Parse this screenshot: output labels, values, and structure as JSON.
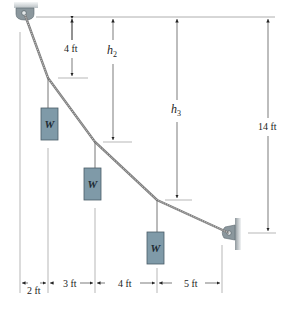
{
  "figure": {
    "type": "cable with three suspended weights",
    "weights": [
      {
        "label": "W"
      },
      {
        "label": "W"
      },
      {
        "label": "W"
      }
    ],
    "vertical_dimensions": [
      {
        "label": "4 ft"
      },
      {
        "label": "h",
        "sub": "2"
      },
      {
        "label": "h",
        "sub": "3"
      },
      {
        "label": "14 ft"
      }
    ],
    "horizontal_dimensions": [
      {
        "label": "2 ft"
      },
      {
        "label": "3 ft"
      },
      {
        "label": "4 ft"
      },
      {
        "label": "5 ft"
      }
    ],
    "colors": {
      "weight_fill": "#7f9aa8",
      "weight_stroke": "#4a5c66",
      "support": "#9aa4aa",
      "cable": "#8a8a8a",
      "dim_line": "#555555"
    }
  }
}
